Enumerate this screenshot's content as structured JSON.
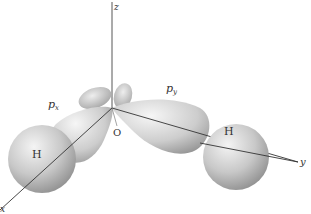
{
  "diagram": {
    "axes": [
      {
        "name": "x",
        "label": "x"
      },
      {
        "name": "y",
        "label": "y"
      },
      {
        "name": "z",
        "label": "z"
      }
    ],
    "origin_label": "O",
    "orbitals": [
      {
        "name": "px",
        "label_main": "p",
        "label_sub": "x"
      },
      {
        "name": "py",
        "label_main": "p",
        "label_sub": "y"
      }
    ],
    "atoms": [
      {
        "name": "hydrogen-left",
        "label": "H"
      },
      {
        "name": "hydrogen-right",
        "label": "H"
      }
    ],
    "colors": {
      "background": "#ffffff",
      "lobe_light": "#f2f2f2",
      "lobe_dark": "#8a8a8a",
      "axis": "#333333",
      "text": "#333333"
    }
  }
}
